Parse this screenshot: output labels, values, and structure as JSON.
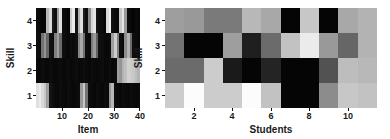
{
  "figure": {
    "background": "#ffffff",
    "panel_count": 2
  },
  "chart_data": [
    {
      "type": "heatmap",
      "id": "left-heatmap",
      "title": "",
      "xlabel": "Item",
      "ylabel": "Skill",
      "xticks": [
        10,
        20,
        30,
        40
      ],
      "yticks": [
        1,
        2,
        3,
        4
      ],
      "xlim": [
        0,
        40
      ],
      "ylim": [
        0,
        4
      ],
      "grid": false,
      "colormap": "gray",
      "vmin": 0,
      "vmax": 1,
      "ncols": 40,
      "nrows": 4,
      "row_order_top_to_bottom": [
        4,
        3,
        2,
        1
      ],
      "values_top_to_bottom": [
        [
          0.05,
          0.04,
          0.02,
          0.03,
          0.72,
          0.85,
          0.1,
          0.06,
          0.62,
          0.88,
          0.05,
          0.04,
          0.03,
          0.8,
          0.92,
          0.08,
          0.7,
          0.88,
          0.12,
          0.06,
          0.55,
          0.84,
          0.9,
          0.08,
          0.05,
          0.04,
          0.02,
          0.86,
          0.94,
          0.06,
          0.04,
          0.03,
          0.78,
          0.9,
          0.6,
          0.05,
          0.03,
          0.02,
          0.04,
          0.03
        ],
        [
          0.06,
          0.05,
          0.45,
          0.58,
          0.4,
          0.07,
          0.05,
          0.5,
          0.62,
          0.42,
          0.06,
          0.04,
          0.03,
          0.05,
          0.04,
          0.06,
          0.52,
          0.66,
          0.44,
          0.05,
          0.04,
          0.48,
          0.6,
          0.38,
          0.06,
          0.05,
          0.04,
          0.03,
          0.05,
          0.62,
          0.8,
          0.5,
          0.06,
          0.04,
          0.55,
          0.7,
          0.42,
          0.05,
          0.04,
          0.03
        ],
        [
          0.04,
          0.03,
          0.05,
          0.04,
          0.03,
          0.05,
          0.04,
          0.03,
          0.04,
          0.05,
          0.03,
          0.04,
          0.05,
          0.03,
          0.04,
          0.05,
          0.03,
          0.04,
          0.05,
          0.04,
          0.03,
          0.05,
          0.04,
          0.03,
          0.04,
          0.05,
          0.03,
          0.04,
          0.05,
          0.03,
          0.04,
          0.62,
          0.58,
          0.7,
          0.75,
          0.82,
          0.8,
          0.78,
          0.74,
          0.7
        ],
        [
          0.88,
          0.92,
          0.85,
          0.78,
          0.62,
          0.08,
          0.05,
          0.04,
          0.03,
          0.05,
          0.04,
          0.03,
          0.05,
          0.04,
          0.03,
          0.04,
          0.05,
          0.6,
          0.78,
          0.45,
          0.05,
          0.04,
          0.03,
          0.05,
          0.04,
          0.03,
          0.05,
          0.04,
          0.58,
          0.72,
          0.05,
          0.04,
          0.03,
          0.05,
          0.04,
          0.03,
          0.05,
          0.04,
          0.03,
          0.04
        ]
      ]
    },
    {
      "type": "heatmap",
      "id": "right-heatmap",
      "title": "",
      "xlabel": "Students",
      "ylabel": "Skill",
      "xticks": [
        2,
        4,
        6,
        8,
        10
      ],
      "yticks": [
        1,
        2,
        3,
        4
      ],
      "xlim": [
        0,
        11
      ],
      "ylim": [
        0,
        4
      ],
      "grid": false,
      "colormap": "gray",
      "vmin": 0,
      "vmax": 1,
      "ncols": 11,
      "nrows": 4,
      "row_order_top_to_bottom": [
        4,
        3,
        2,
        1
      ],
      "values_top_to_bottom": [
        [
          0.62,
          0.6,
          0.48,
          0.48,
          0.72,
          0.66,
          0.02,
          0.78,
          0.02,
          0.66,
          0.7
        ],
        [
          0.45,
          0.02,
          0.02,
          0.62,
          0.12,
          0.42,
          0.76,
          0.92,
          0.6,
          0.4,
          0.7
        ],
        [
          0.42,
          0.42,
          0.8,
          0.1,
          0.02,
          0.14,
          0.02,
          0.02,
          0.32,
          0.74,
          0.72
        ],
        [
          0.8,
          0.99,
          0.8,
          0.8,
          0.99,
          0.76,
          0.02,
          0.02,
          0.55,
          0.78,
          0.76
        ]
      ]
    }
  ]
}
